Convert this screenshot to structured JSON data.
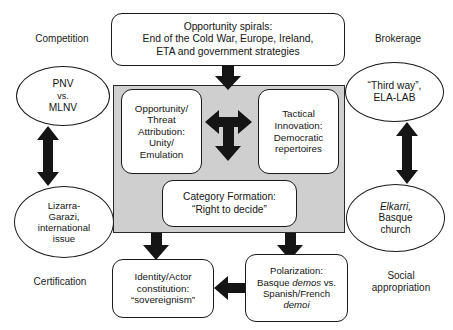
{
  "diagram": {
    "title_box": {
      "id": "opportunity-spirals",
      "lines": [
        "Opportunity spirals:",
        "End of the Cold War, Europe, Ireland,",
        "ETA and government strategies"
      ]
    },
    "corner_labels": {
      "top_left": "Competition",
      "top_right": "Brokerage",
      "bottom_left": "Certification",
      "bottom_right_line1": "Social",
      "bottom_right_line2": "appropriation"
    },
    "ellipses": [
      {
        "id": "pnv-mlnv",
        "position": "top-left",
        "lines": [
          "PNV",
          "vs.",
          "MLNV"
        ]
      },
      {
        "id": "third-way-ela-lab",
        "position": "top-right",
        "lines": [
          "“Third way”,",
          "ELA-LAB"
        ]
      },
      {
        "id": "lizarra-garazi",
        "position": "bottom-left",
        "lines": [
          "Lizarra-",
          "Garazi,",
          "international",
          "issue"
        ]
      },
      {
        "id": "elkarri-basque-church",
        "position": "bottom-right",
        "lines": [
          "Elkarri,",
          "Basque",
          "church"
        ],
        "italic_first_line": true
      }
    ],
    "inner_boxes": [
      {
        "id": "opportunity-threat-attribution",
        "lines": [
          "Opportunity/",
          "Threat",
          "Attribution:",
          "Unity/",
          "Emulation"
        ]
      },
      {
        "id": "tactical-innovation",
        "lines": [
          "Tactical",
          "Innovation:",
          "Democratic",
          "repertoires"
        ]
      },
      {
        "id": "category-formation",
        "lines": [
          "Category Formation:",
          "“Right to decide”"
        ]
      }
    ],
    "bottom_boxes": [
      {
        "id": "identity-actor-constitution",
        "lines": [
          "Identity/Actor",
          "constitution:",
          "“sovereignism”"
        ]
      },
      {
        "id": "polarization",
        "lines": [
          "Polarization:",
          "Basque demos vs.",
          "Spanish/French",
          "demoi"
        ],
        "italic_words": [
          "demos",
          "demoi"
        ]
      }
    ],
    "colors": {
      "panel_fill": "#cfcfcf",
      "stroke": "#1a1a1a",
      "arrow_fill": "#151515",
      "background": "#ffffff"
    },
    "arrows": [
      {
        "id": "spirals-to-panel",
        "type": "single-down"
      },
      {
        "id": "attribution-innovation-tee",
        "type": "tee-left-right-down"
      },
      {
        "id": "pnv-to-lizarra",
        "type": "double-vertical"
      },
      {
        "id": "thirdway-to-elkarri",
        "type": "double-vertical"
      },
      {
        "id": "panel-to-identity",
        "type": "single-down"
      },
      {
        "id": "panel-to-polarization",
        "type": "single-down"
      },
      {
        "id": "identity-polarization",
        "type": "double-horizontal"
      }
    ]
  }
}
